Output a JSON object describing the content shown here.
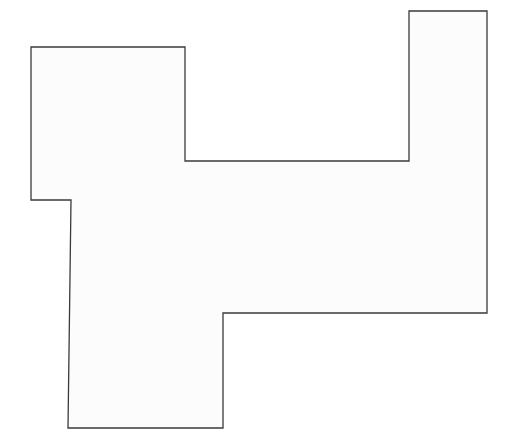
{
  "figure": {
    "kind": "polygon-diagram",
    "canvas": {
      "width": 505,
      "height": 436,
      "background_color": "#ffffff"
    },
    "shape": {
      "name": "irregular-orthogonal-polygon",
      "fill_color": "#fcfcfc",
      "stroke_color": "#3a3a3a",
      "stroke_width": 1.3,
      "vertex_count": 12,
      "closed": true,
      "points_attr": "31,47 185,47 185,161 409,161 409,11 487,11 487,313 223,313 223,428 68,428 71,200 31,200",
      "vertices": [
        {
          "label": "top-left",
          "x": 31,
          "y": 47
        },
        {
          "label": "top-notch-right",
          "x": 185,
          "y": 47
        },
        {
          "label": "notch-inner-left",
          "x": 185,
          "y": 161
        },
        {
          "label": "notch-inner-right",
          "x": 409,
          "y": 161
        },
        {
          "label": "right-tower-top-left",
          "x": 409,
          "y": 11
        },
        {
          "label": "right-tower-top-right",
          "x": 487,
          "y": 11
        },
        {
          "label": "right-bottom",
          "x": 487,
          "y": 313
        },
        {
          "label": "step-inner-right",
          "x": 223,
          "y": 313
        },
        {
          "label": "column-bottom-right",
          "x": 223,
          "y": 428
        },
        {
          "label": "column-bottom-left",
          "x": 68,
          "y": 428
        },
        {
          "label": "left-step-inner",
          "x": 71,
          "y": 200
        },
        {
          "label": "left-bottom",
          "x": 31,
          "y": 200
        }
      ]
    },
    "labels": {
      "has_text": false,
      "has_axes": false,
      "has_legend": false,
      "has_grid": false,
      "has_dimensions": false
    }
  },
  "chart_data": {
    "type": "polygon",
    "xlabel": "",
    "ylabel": "",
    "xlim": [
      0,
      505
    ],
    "ylim": [
      0,
      436
    ],
    "grid": false,
    "legend": null,
    "series": [
      {
        "name": "outline",
        "closed": true,
        "fill": "#fcfcfc",
        "stroke": "#3a3a3a",
        "x": [
          31,
          185,
          185,
          409,
          409,
          487,
          487,
          223,
          223,
          68,
          71,
          31
        ],
        "y": [
          47,
          47,
          161,
          161,
          11,
          11,
          313,
          313,
          428,
          428,
          200,
          200
        ]
      }
    ]
  }
}
